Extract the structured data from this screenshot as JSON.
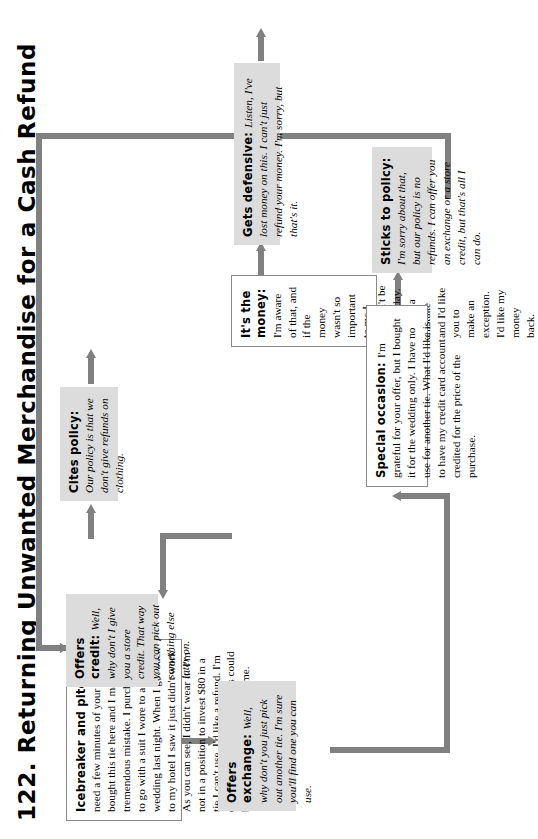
{
  "page": {
    "title": "122. Returning Unwanted Merchandise for a Cash Refund",
    "number": "122"
  },
  "flow": {
    "nodes": [
      {
        "id": "icebreaker",
        "speaker": "customer",
        "style": "white",
        "label": "Icebreaker and pitch:",
        "body": "I need a few minutes of your time. I bought this tie here and I made a tremendous mistake. I purchased it to go with a suit I wore to a wedding last night. When I got back to my hotel I saw it just didn't work. As you can see, I didn't wear it. I'm not in a position to invest $80 in a tie I can't use. I'd like a refund. I'm embarrassed about it, but this could be an expensive mistake for me."
      },
      {
        "id": "offers-exchange",
        "speaker": "clerk",
        "style": "gray",
        "label": "Offers exchange:",
        "body": "Well, why don't you just pick out another tie. I'm sure you'll find one you can use."
      },
      {
        "id": "cites-policy",
        "speaker": "clerk",
        "style": "gray",
        "label": "Cites policy:",
        "body": "Our policy is that we don't give refunds on clothing."
      },
      {
        "id": "offers-credit",
        "speaker": "clerk",
        "style": "gray",
        "label": "Offers credit:",
        "body": "Well, why don't I give you a store credit. That way you can pick out something else later on."
      },
      {
        "id": "its-the-money",
        "speaker": "customer",
        "style": "white",
        "label": "It's the money:",
        "body": "I'm aware of that, and if the money wasn't so important to me I wouldn't be here today. I made a mistake and I'd like you to make an exception. I'd like my money back."
      },
      {
        "id": "special-occasion",
        "speaker": "customer",
        "style": "white",
        "label": "Special occasion:",
        "body": "I'm grateful for your offer, but I bought it for the wedding only. I have no use for another tie. What I'd like is to have my credit card account credited for the price of the purchase."
      },
      {
        "id": "sticks-to-policy",
        "speaker": "clerk",
        "style": "gray",
        "label": "Sticks to policy:",
        "body": "I'm sorry about that, but our policy is no refunds. I can offer you an exchange or a store credit, but that's all I can do."
      },
      {
        "id": "gets-defensive",
        "speaker": "clerk",
        "style": "gray",
        "label": "Gets defensive:",
        "body": "Listen, I've lost money on this. I can't just refund your money. I'm sorry, but that's it."
      }
    ],
    "connectors": [
      {
        "from": "icebreaker",
        "to": "offers-exchange"
      },
      {
        "from": "icebreaker",
        "to": "cites-policy"
      },
      {
        "from": "offers-exchange",
        "to": "special-occasion"
      },
      {
        "from": "cites-policy",
        "to": "its-the-money"
      },
      {
        "from": "offers-credit",
        "to": "its-the-money"
      },
      {
        "from": "its-the-money",
        "to": "gets-defensive"
      },
      {
        "from": "special-occasion",
        "to": "sticks-to-policy"
      },
      {
        "from": "sticks-to-policy",
        "to": "offers-credit"
      },
      {
        "from": "gets-defensive",
        "to": "exit"
      }
    ]
  },
  "colors": {
    "node_fill_gray": "#dcdcdc",
    "node_fill_white": "#ffffff",
    "connector": "#808080",
    "border": "#8a8a8a",
    "text": "#000000"
  }
}
